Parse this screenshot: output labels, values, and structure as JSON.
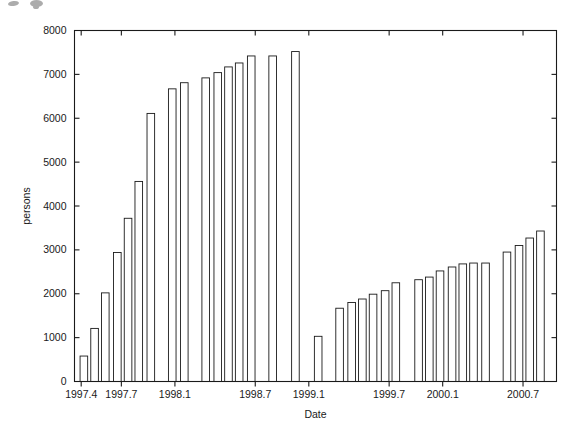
{
  "chart_data": {
    "type": "bar",
    "title": "",
    "subtitle": "",
    "xlabel": "Date",
    "ylabel": "persons",
    "grid": false,
    "legend": null,
    "ylim": [
      0,
      8000
    ],
    "ytick_labels": [
      "0",
      "1000",
      "2000",
      "3000",
      "4000",
      "5000",
      "6000",
      "7000",
      "8000"
    ],
    "ytick_values": [
      0,
      1000,
      2000,
      3000,
      4000,
      5000,
      6000,
      7000,
      8000
    ],
    "xlim": [
      1997.35,
      2000.95
    ],
    "xtick_labels": [
      "1997.4",
      "1997.7",
      "1998.1",
      "1998.7",
      "1999.1",
      "1999.7",
      "2000.1",
      "2000.7"
    ],
    "xtick_values": [
      1997.4,
      1997.7,
      1998.1,
      1998.7,
      1999.1,
      1999.7,
      2000.1,
      2000.7
    ],
    "bar_fill": "#ffffff",
    "bar_edge": "#1a1a1a",
    "axis_color": "#1a1a1a",
    "x": [
      1997.42,
      1997.5,
      1997.58,
      1997.67,
      1997.75,
      1997.83,
      1997.92,
      1998.08,
      1998.17,
      1998.33,
      1998.42,
      1998.5,
      1998.58,
      1998.67,
      1998.83,
      1999.0,
      1999.17,
      1999.33,
      1999.42,
      1999.5,
      1999.58,
      1999.67,
      1999.75,
      1999.92,
      2000.0,
      2000.08,
      2000.17,
      2000.25,
      2000.33,
      2000.42,
      2000.58,
      2000.67,
      2000.75,
      2000.83
    ],
    "values": [
      580,
      1210,
      2020,
      2940,
      3720,
      4560,
      6110,
      6670,
      6810,
      6920,
      7040,
      7170,
      7260,
      7420,
      7420,
      7520,
      1030,
      1670,
      1800,
      1880,
      1990,
      2070,
      2250,
      2320,
      2380,
      2520,
      2610,
      2680,
      2700,
      2700,
      2950,
      3100,
      3270,
      3430
    ]
  },
  "figure": {
    "scan_artifact_label": "scan-artifact"
  }
}
